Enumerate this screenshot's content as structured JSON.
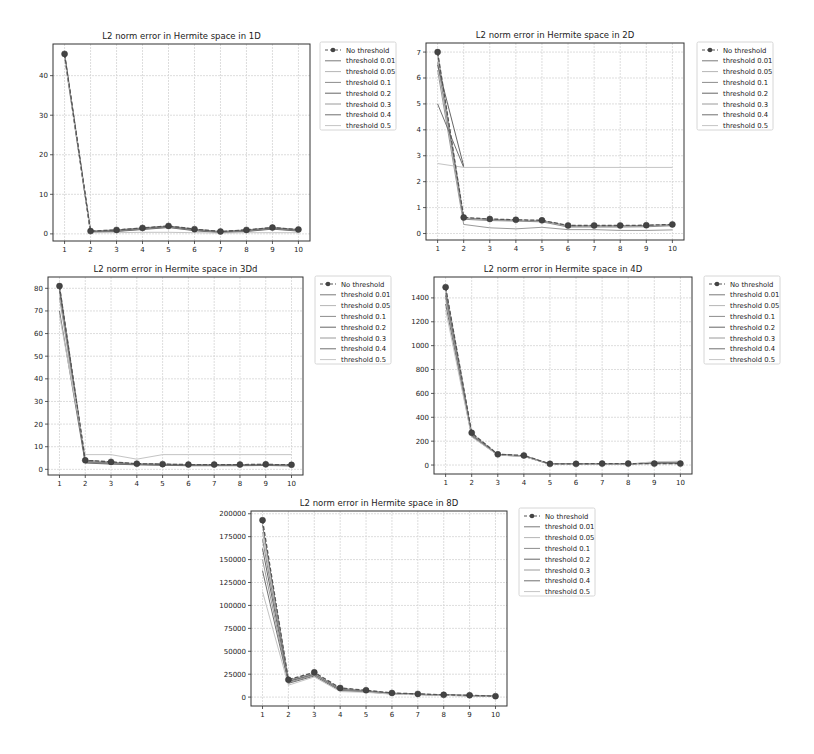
{
  "chart_data": [
    {
      "type": "line",
      "title": "L2 norm error in Hermite space in 1D",
      "xlabel": "",
      "ylabel": "",
      "x": [
        1,
        2,
        3,
        4,
        5,
        6,
        7,
        8,
        9,
        10
      ],
      "xticks": [
        "1",
        "2",
        "3",
        "4",
        "5",
        "6",
        "7",
        "8",
        "9",
        "10"
      ],
      "yticks": [
        0,
        10,
        20,
        30,
        40
      ],
      "ylim": [
        -1.8,
        48
      ],
      "grid": true,
      "legend": "outside-right-top",
      "series": [
        {
          "name": "No threshold",
          "style": "dashed-marker",
          "values": [
            45.5,
            0.7,
            1.0,
            1.5,
            2.0,
            1.2,
            0.6,
            1.0,
            1.6,
            1.1
          ]
        },
        {
          "name": "threshold 0.01",
          "values": [
            45.5,
            0.7,
            1.0,
            1.5,
            2.0,
            1.2,
            0.6,
            1.0,
            1.6,
            1.1
          ]
        },
        {
          "name": "threshold 0.05",
          "values": [
            45.4,
            0.6,
            0.9,
            1.4,
            1.9,
            1.1,
            0.5,
            0.9,
            1.5,
            1.0
          ]
        },
        {
          "name": "threshold 0.1",
          "values": [
            45.3,
            0.6,
            0.9,
            1.4,
            1.9,
            1.1,
            0.5,
            0.9,
            1.5,
            1.0
          ]
        },
        {
          "name": "threshold 0.2",
          "values": [
            45.2,
            0.5,
            0.8,
            1.3,
            1.8,
            1.0,
            0.5,
            0.8,
            1.4,
            0.9
          ]
        },
        {
          "name": "threshold 0.3",
          "values": [
            45.0,
            0.4,
            0.7,
            1.2,
            1.7,
            0.9,
            0.4,
            0.7,
            1.3,
            0.8
          ]
        },
        {
          "name": "threshold 0.4",
          "values": [
            44.8,
            0.4,
            0.6,
            1.1,
            1.6,
            0.8,
            0.3,
            0.6,
            1.2,
            0.7
          ]
        },
        {
          "name": "threshold 0.5",
          "values": [
            44.5,
            0.3,
            0.3,
            0.4,
            0.4,
            0.3,
            0.2,
            0.3,
            0.3,
            0.3
          ]
        }
      ]
    },
    {
      "type": "line",
      "title": "L2 norm error in Hermite space in 2D",
      "xlabel": "",
      "ylabel": "",
      "x": [
        1,
        2,
        3,
        4,
        5,
        6,
        7,
        8,
        9,
        10
      ],
      "xticks": [
        "1",
        "2",
        "3",
        "4",
        "5",
        "6",
        "7",
        "8",
        "9",
        "10"
      ],
      "yticks": [
        0,
        1,
        2,
        3,
        4,
        5,
        6,
        7
      ],
      "ylim": [
        -0.25,
        7.35
      ],
      "grid": true,
      "legend": "outside-right-top",
      "series": [
        {
          "name": "No threshold",
          "style": "dashed-marker",
          "values": [
            7.0,
            0.62,
            0.56,
            0.53,
            0.51,
            0.31,
            0.31,
            0.31,
            0.32,
            0.35
          ]
        },
        {
          "name": "threshold 0.01",
          "values": [
            6.95,
            0.6,
            0.55,
            0.52,
            0.5,
            0.3,
            0.3,
            0.3,
            0.31,
            0.34
          ]
        },
        {
          "name": "threshold 0.05",
          "values": [
            6.8,
            0.58,
            0.53,
            0.5,
            0.48,
            0.28,
            0.28,
            0.28,
            0.29,
            0.32
          ]
        },
        {
          "name": "threshold 0.1",
          "values": [
            6.6,
            0.55,
            0.5,
            0.48,
            0.45,
            0.25,
            0.25,
            0.25,
            0.26,
            0.3
          ]
        },
        {
          "name": "threshold 0.2",
          "values": [
            6.5,
            2.6
          ]
        },
        {
          "name": "threshold 0.3",
          "values": [
            6.3,
            0.35,
            0.22,
            0.18,
            0.24,
            0.15,
            0.15,
            0.12,
            0.12,
            0.14
          ]
        },
        {
          "name": "threshold 0.4",
          "values": [
            5.0,
            2.55
          ]
        },
        {
          "name": "threshold 0.5",
          "values": [
            2.7,
            2.55,
            2.55,
            2.55,
            2.55,
            2.55,
            2.55,
            2.55,
            2.55,
            2.55
          ]
        }
      ]
    },
    {
      "type": "line",
      "title": "L2 norm error in Hermite space in 3Dd",
      "xlabel": "",
      "ylabel": "",
      "x": [
        1,
        2,
        3,
        4,
        5,
        6,
        7,
        8,
        9,
        10
      ],
      "xticks": [
        "1",
        "2",
        "3",
        "4",
        "5",
        "6",
        "7",
        "8",
        "9",
        "10"
      ],
      "yticks": [
        0,
        10,
        20,
        30,
        40,
        50,
        60,
        70,
        80
      ],
      "ylim": [
        -2.5,
        85
      ],
      "grid": true,
      "legend": "outside-right-top",
      "series": [
        {
          "name": "No threshold",
          "style": "dashed-marker",
          "values": [
            81.0,
            4.0,
            3.3,
            2.5,
            2.3,
            2.1,
            2.1,
            2.1,
            2.2,
            2.0
          ]
        },
        {
          "name": "threshold 0.01",
          "values": [
            81.0,
            4.0,
            3.2,
            2.5,
            2.3,
            2.1,
            2.1,
            2.1,
            2.2,
            2.0
          ]
        },
        {
          "name": "threshold 0.05",
          "values": [
            80.5,
            3.8,
            3.0,
            2.4,
            2.2,
            2.0,
            2.0,
            2.0,
            2.1,
            1.9
          ]
        },
        {
          "name": "threshold 0.1",
          "values": [
            80.0,
            3.5,
            2.8,
            2.3,
            2.1,
            1.9,
            1.9,
            1.9,
            2.0,
            1.8
          ]
        },
        {
          "name": "threshold 0.2",
          "values": [
            79.0,
            3.2,
            2.6,
            2.2,
            2.0,
            1.8,
            1.8,
            1.8,
            1.9,
            1.7
          ]
        },
        {
          "name": "threshold 0.3",
          "values": [
            76.0,
            3.0,
            2.5,
            2.1,
            1.9,
            1.7,
            1.7,
            1.7,
            1.8,
            1.6
          ]
        },
        {
          "name": "threshold 0.4",
          "values": [
            70.0,
            2.8,
            2.3,
            2.0,
            1.8,
            1.6,
            1.6,
            1.6,
            1.7,
            1.5
          ]
        },
        {
          "name": "threshold 0.5",
          "values": [
            68.0,
            6.5,
            6.5,
            4.5,
            6.5,
            6.5,
            6.5,
            6.5,
            6.5,
            6.5
          ]
        }
      ]
    },
    {
      "type": "line",
      "title": "L2 norm error in Hermite space in 4D",
      "xlabel": "",
      "ylabel": "",
      "x": [
        1,
        2,
        3,
        4,
        5,
        6,
        7,
        8,
        9,
        10
      ],
      "xticks": [
        "1",
        "2",
        "3",
        "4",
        "5",
        "6",
        "7",
        "8",
        "9",
        "10"
      ],
      "yticks": [
        0,
        200,
        400,
        800,
        1000,
        1200,
        1400,
        600
      ],
      "ylim": [
        -75,
        1575
      ],
      "grid": true,
      "legend": "outside-right-top",
      "series": [
        {
          "name": "No threshold",
          "style": "dashed-marker",
          "values": [
            1490,
            270,
            90,
            80,
            10,
            10,
            12,
            12,
            12,
            12
          ]
        },
        {
          "name": "threshold 0.01",
          "values": [
            1480,
            265,
            90,
            78,
            9,
            9,
            11,
            11,
            12,
            12
          ]
        },
        {
          "name": "threshold 0.05",
          "values": [
            1460,
            260,
            88,
            77,
            9,
            9,
            10,
            10,
            14,
            14
          ]
        },
        {
          "name": "threshold 0.1",
          "values": [
            1440,
            255,
            87,
            76,
            8,
            8,
            10,
            10,
            16,
            16
          ]
        },
        {
          "name": "threshold 0.2",
          "values": [
            1420,
            250,
            86,
            75,
            8,
            8,
            9,
            9,
            18,
            18
          ]
        },
        {
          "name": "threshold 0.3",
          "values": [
            1400,
            245,
            85,
            74,
            7,
            7,
            9,
            9,
            20,
            22
          ]
        },
        {
          "name": "threshold 0.4",
          "values": [
            1350,
            240,
            84,
            73,
            7,
            7,
            8,
            8,
            22,
            26
          ]
        },
        {
          "name": "threshold 0.5",
          "values": [
            1300,
            235,
            83,
            72,
            6,
            6,
            8,
            8,
            28,
            32
          ]
        }
      ]
    },
    {
      "type": "line",
      "title": "L2 norm error in Hermite space in 8D",
      "xlabel": "",
      "ylabel": "",
      "x": [
        1,
        2,
        3,
        4,
        5,
        6,
        7,
        8,
        9,
        10
      ],
      "xticks": [
        "1",
        "2",
        "3",
        "4",
        "5",
        "6",
        "7",
        "8",
        "9",
        "10"
      ],
      "yticks": [
        0,
        25000,
        50000,
        75000,
        100000,
        125000,
        150000,
        175000,
        200000
      ],
      "ylim": [
        -9700,
        203000
      ],
      "grid": true,
      "legend": "outside-right-top",
      "series": [
        {
          "name": "No threshold",
          "style": "dashed-marker",
          "values": [
            193000,
            19000,
            27000,
            10000,
            7500,
            4500,
            3500,
            2500,
            2000,
            1000
          ]
        },
        {
          "name": "threshold 0.01",
          "values": [
            188000,
            18500,
            26000,
            9500,
            7000,
            4300,
            3300,
            2400,
            1900,
            950
          ]
        },
        {
          "name": "threshold 0.05",
          "values": [
            180000,
            18000,
            25500,
            9000,
            6800,
            4200,
            3200,
            2300,
            1800,
            900
          ]
        },
        {
          "name": "threshold 0.1",
          "values": [
            172000,
            17500,
            25000,
            8500,
            6500,
            4000,
            3100,
            2200,
            1700,
            850
          ]
        },
        {
          "name": "threshold 0.2",
          "values": [
            162000,
            17000,
            24500,
            8000,
            6200,
            3800,
            3000,
            2100,
            1600,
            800
          ]
        },
        {
          "name": "threshold 0.3",
          "values": [
            150000,
            16000,
            24000,
            7500,
            6000,
            3600,
            2900,
            2000,
            1500,
            750
          ]
        },
        {
          "name": "threshold 0.4",
          "values": [
            138000,
            15000,
            23000,
            7000,
            5700,
            3400,
            2800,
            1900,
            1400,
            700
          ]
        },
        {
          "name": "threshold 0.5",
          "values": [
            115000,
            13000,
            22000,
            6000,
            5200,
            3200,
            2600,
            1800,
            1300,
            650
          ]
        }
      ]
    }
  ],
  "series_colors": [
    "#555555",
    "#7a7a7a",
    "#b5b5b5",
    "#8c8c8c",
    "#666666",
    "#9a9a9a",
    "#707070",
    "#c4c4c4"
  ]
}
